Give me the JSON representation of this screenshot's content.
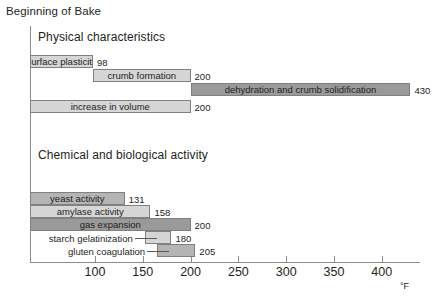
{
  "chart_data": {
    "type": "bar",
    "subtype": "horizontal-range-gantt",
    "title": "Beginning of Bake",
    "xlabel": "°F",
    "ylabel": "",
    "xlim": [
      32,
      440
    ],
    "xticks": [
      100,
      150,
      200,
      250,
      300,
      350,
      400
    ],
    "xtick_labels": [
      "100",
      "150",
      "200",
      "250",
      "300",
      "350",
      "400"
    ],
    "grid": false,
    "legend": "none",
    "sections": [
      {
        "name": "Physical characteristics",
        "bars": [
          {
            "label": "surface plasticity",
            "start": 32,
            "end": 98,
            "value_label": "98",
            "shade": "light",
            "label_position": "inside"
          },
          {
            "label": "crumb formation",
            "start": 98,
            "end": 200,
            "value_label": "200",
            "shade": "light",
            "label_position": "inside"
          },
          {
            "label": "dehydration and crumb solidification",
            "start": 200,
            "end": 430,
            "value_label": "430",
            "shade": "dark",
            "label_position": "inside"
          },
          {
            "label": "increase in volume",
            "start": 32,
            "end": 200,
            "value_label": "200",
            "shade": "light",
            "label_position": "inside"
          }
        ]
      },
      {
        "name": "Chemical and biological activity",
        "bars": [
          {
            "label": "yeast activity",
            "start": 32,
            "end": 131,
            "value_label": "131",
            "shade": "mid",
            "label_position": "inside"
          },
          {
            "label": "amylase activity",
            "start": 32,
            "end": 158,
            "value_label": "158",
            "shade": "light",
            "label_position": "inside"
          },
          {
            "label": "gas expansion",
            "start": 32,
            "end": 200,
            "value_label": "200",
            "shade": "dark",
            "label_position": "inside"
          },
          {
            "label": "starch gelatinization",
            "start": 152,
            "end": 180,
            "value_label": "180",
            "shade": "light",
            "label_position": "outside"
          },
          {
            "label": "gluten coagulation",
            "start": 165,
            "end": 205,
            "value_label": "205",
            "shade": "mid",
            "label_position": "outside"
          }
        ]
      }
    ]
  },
  "axis": {
    "unit": "°F"
  }
}
